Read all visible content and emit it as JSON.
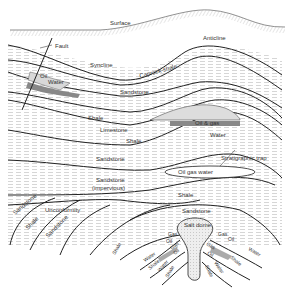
{
  "diagram": {
    "type": "geological cross-section",
    "labels": {
      "surface": "Surface",
      "fault": "Fault",
      "anticline": "Anticline",
      "syncline": "Syncline",
      "oil": "Oil",
      "water": "Water",
      "caprock_shale": "Caprock-shale",
      "sandstone_upper": "Sandstone",
      "shale_1": "Shale",
      "limestone": "Limestone",
      "shale_2": "Shale",
      "oil_gas": "Oil & gas",
      "water_2": "Water",
      "sandstone_mid": "Sandstone",
      "stratigraphic_trap": "Stratigraphic trap",
      "oil_gas_water": "Oil gas water",
      "sandstone_impervious_1": "Sandstone",
      "sandstone_impervious_2": "(impervious)",
      "shale_3": "Shale",
      "sandstone_left": "Sandstone",
      "unconformity": "Unconformity",
      "shale_left": "Shale",
      "sandstone_left2": "Sandstone",
      "sandstone_dome": "Sandstone",
      "salt_dome": "Salt dome",
      "gas_l": "Gas",
      "oil_l": "Oil",
      "gas_l2": "Gas",
      "oil_l2": "Oil",
      "water_l": "Water",
      "shale_l": "Shale",
      "water_l2": "Water",
      "shale_l2": "Shale",
      "gas_r": "Gas",
      "oil_r": "Oil",
      "gas_r2": "Gas",
      "oil_r2": "Oil",
      "water_r": "Water",
      "shale_r": "Shale",
      "water_r2": "Water",
      "shale_r2": "Shale",
      "shale_bottom": "Shale"
    },
    "colors": {
      "line": "#222222",
      "hatch": "#999999",
      "fill_oil": "#d8d8d8",
      "fill_water": "#8a8a8a",
      "fill_salt": "#e4e4e4"
    }
  }
}
